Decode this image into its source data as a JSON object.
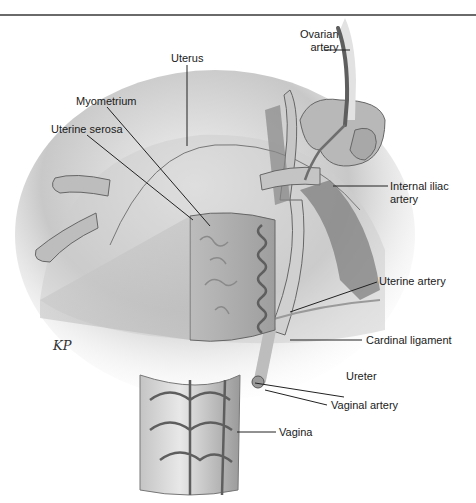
{
  "figure": {
    "artist_signature": "KP"
  },
  "labels": {
    "ovarian_artery_line1": "Ovarian",
    "ovarian_artery_line2": "artery",
    "uterus": "Uterus",
    "myometrium": "Myometrium",
    "uterine_serosa": "Uterine serosa",
    "internal_iliac_line1": "Internal iliac",
    "internal_iliac_line2": "artery",
    "uterine_artery": "Uterine artery",
    "cardinal_ligament": "Cardinal ligament",
    "ureter": "Ureter",
    "vaginal_artery": "Vaginal artery",
    "vagina": "Vagina"
  },
  "colors": {
    "tissue_light": "#d9d9d9",
    "tissue_mid": "#a8a8a8",
    "vessel": "#7a7a7a",
    "vessel_dark": "#555555",
    "leader_line": "#222222"
  }
}
